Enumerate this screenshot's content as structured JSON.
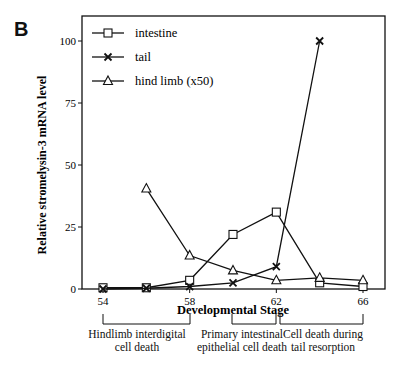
{
  "panel_label": "B",
  "chart_data": {
    "type": "line",
    "title": "",
    "xlabel": "Developmental Stage",
    "ylabel": "Relative stromelysin-3 mRNA level",
    "xlim": [
      52.5,
      67.5
    ],
    "ylim": [
      0,
      110
    ],
    "x_ticks": [
      54,
      58,
      62,
      66
    ],
    "y_ticks": [
      0,
      25,
      50,
      75,
      100
    ],
    "grid": false,
    "legend_position": "upper-left",
    "series": [
      {
        "name": "intestine",
        "marker": "square",
        "x": [
          54,
          56,
          58,
          60,
          62,
          64,
          66
        ],
        "values": [
          0.5,
          0.5,
          3.5,
          22,
          31,
          2.5,
          1
        ]
      },
      {
        "name": "tail",
        "marker": "x",
        "x": [
          54,
          56,
          58,
          60,
          62,
          64
        ],
        "values": [
          0,
          0.3,
          1,
          2.5,
          9,
          100
        ]
      },
      {
        "name": "hind limb (x50)",
        "marker": "triangle",
        "x": [
          56,
          58,
          60,
          62,
          64,
          66
        ],
        "values": [
          40.5,
          13.5,
          7.5,
          3.5,
          4.5,
          3.5
        ]
      }
    ],
    "annotations": [
      {
        "label": "Hindlimb interdigital cell death",
        "x_range": [
          54,
          58
        ]
      },
      {
        "label": "Primary intestinal epithelial cell death",
        "x_range": [
          60,
          62
        ]
      },
      {
        "label": "Cell death during tail resorption",
        "x_range": [
          62,
          66
        ]
      }
    ]
  },
  "annotations": {
    "a1_line1": "Hindlimb interdigital",
    "a1_line2": "cell death",
    "a2_line1": "Primary intestinal",
    "a2_line2": "epithelial cell death",
    "a3_line1": "Cell death during",
    "a3_line2": "tail resorption"
  }
}
